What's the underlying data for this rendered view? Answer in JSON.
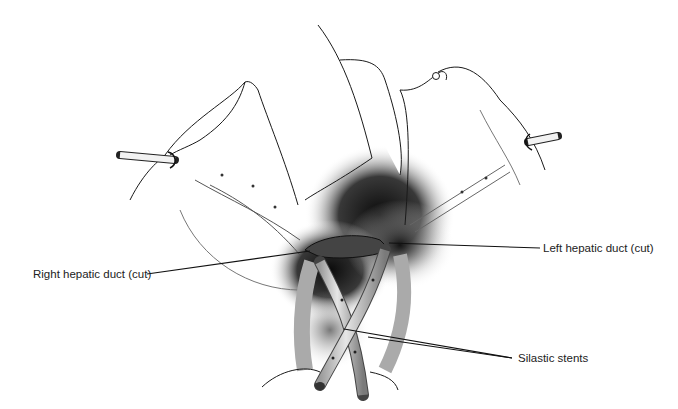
{
  "figure": {
    "labels": [
      {
        "id": "right-hepatic-duct",
        "text": "Right hepatic duct (cut)"
      },
      {
        "id": "left-hepatic-duct",
        "text": "Left hepatic duct (cut)"
      },
      {
        "id": "silastic-stents",
        "text": "Silastic stents"
      }
    ]
  },
  "colors": {
    "background": "#ffffff",
    "line": "#1a1a1a",
    "shadow": "#111111",
    "text": "#222222"
  }
}
